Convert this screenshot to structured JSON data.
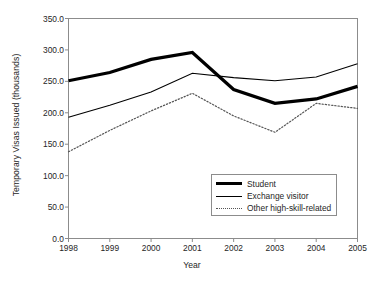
{
  "chart_data": {
    "type": "line",
    "title": "",
    "xlabel": "Year",
    "ylabel": "Temporary Visas Issued (thousands)",
    "categories": [
      "1998",
      "1999",
      "2000",
      "2001",
      "2002",
      "2003",
      "2004",
      "2005"
    ],
    "x": [
      1998,
      1999,
      2000,
      2001,
      2002,
      2003,
      2004,
      2005
    ],
    "ylim": [
      0.0,
      350.0
    ],
    "yticks": [
      "0.0",
      "50.0",
      "100.0",
      "150.0",
      "200.0",
      "250.0",
      "300.0",
      "350.0"
    ],
    "ytick_values": [
      0.0,
      50.0,
      100.0,
      150.0,
      200.0,
      250.0,
      300.0,
      350.0
    ],
    "grid": false,
    "legend_position": "bottom-right",
    "series": [
      {
        "name": "Student",
        "style": "thick-solid",
        "color": "#000000",
        "values": [
          251,
          264,
          285,
          296,
          237,
          215,
          222,
          242
        ]
      },
      {
        "name": "Exchange visitor",
        "style": "thin-solid",
        "color": "#000000",
        "values": [
          193,
          212,
          233,
          263,
          256,
          251,
          257,
          278
        ]
      },
      {
        "name": "Other high-skill-related",
        "style": "dotted",
        "color": "#555555",
        "values": [
          138,
          172,
          203,
          231,
          195,
          169,
          215,
          207
        ]
      }
    ]
  },
  "legend": {
    "items": [
      {
        "label": "Student"
      },
      {
        "label": "Exchange visitor"
      },
      {
        "label": "Other high-skill-related"
      }
    ]
  },
  "axes": {
    "frame_color": "#8c8c8c"
  }
}
